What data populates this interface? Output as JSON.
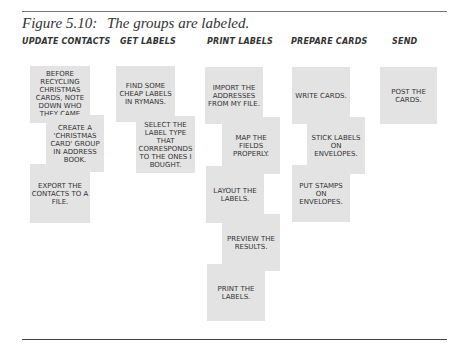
{
  "caption": {
    "figure_label": "Figure 5.10:",
    "text": "The groups are labeled."
  },
  "groups": [
    {
      "header": "UPDATE CONTACTS",
      "cards": [
        "BEFORE RECYCLING CHRISTMAS CARDS, NOTE DOWN WHO THEY CAME FROM.",
        "CREATE A 'CHRISTMAS CARD' GROUP IN ADDRESS BOOK.",
        "EXPORT THE CONTACTS TO A FILE."
      ]
    },
    {
      "header": "GET LABELS",
      "cards": [
        "FIND SOME CHEAP LABELS IN RYMANS.",
        "SELECT THE LABEL TYPE THAT CORRESPONDS TO THE ONES I BOUGHT."
      ]
    },
    {
      "header": "PRINT LABELS",
      "cards": [
        "IMPORT THE ADDRESSES FROM MY FILE.",
        "MAP THE FIELDS PROPERLY.",
        "LAYOUT THE LABELS.",
        "PREVIEW THE RESULTS.",
        "PRINT THE LABELS."
      ]
    },
    {
      "header": "PREPARE CARDS",
      "cards": [
        "WRITE CARDS.",
        "STICK LABELS ON ENVELOPES.",
        "PUT STAMPS ON ENVELOPES."
      ]
    },
    {
      "header": "SEND",
      "cards": [
        "POST THE CARDS."
      ]
    }
  ],
  "colors": {
    "card_fill": "#e3e3e3",
    "text": "#333333",
    "rule": "#555555"
  }
}
